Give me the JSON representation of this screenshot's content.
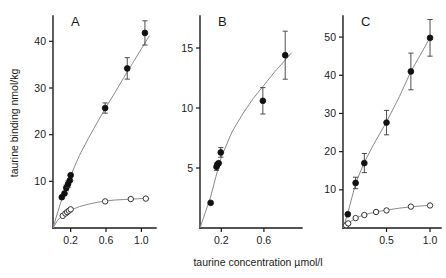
{
  "figure": {
    "xlabel": "taurine concentration  µmol/l",
    "ylabel": "taurine binding  nmol/kg"
  },
  "chart_data": [
    {
      "type": "scatter",
      "panel": "A",
      "title": "A",
      "xlabel": "taurine concentration  µmol/l",
      "ylabel": "taurine binding  nmol/kg",
      "xlim": [
        0,
        1.12
      ],
      "ylim": [
        0,
        45
      ],
      "xticks": [
        0.2,
        0.6,
        1.0
      ],
      "xticklabels": [
        "0.2",
        "0.6",
        "1.0"
      ],
      "yticks": [
        10,
        20,
        30,
        40
      ],
      "yticklabels": [
        "10",
        "20",
        "30",
        "40"
      ],
      "grid": false,
      "legend": null,
      "series": [
        {
          "name": "total binding",
          "marker": "filled-circle",
          "x": [
            0.1,
            0.13,
            0.15,
            0.17,
            0.19,
            0.2,
            0.59,
            0.84,
            1.04
          ],
          "y": [
            6.6,
            7.4,
            8.6,
            9.4,
            10.2,
            11.3,
            25.7,
            34.2,
            41.8
          ],
          "yerr": [
            0.0,
            0.0,
            0.6,
            0.7,
            0.0,
            0.0,
            1.1,
            2.3,
            2.6
          ]
        },
        {
          "name": "non-specific binding",
          "marker": "open-circle",
          "x": [
            0.11,
            0.14,
            0.16,
            0.18,
            0.2,
            0.59,
            0.88,
            1.05
          ],
          "y": [
            2.6,
            3.1,
            3.4,
            3.7,
            4.0,
            5.7,
            6.2,
            6.3
          ],
          "yerr": [
            0.0,
            0.0,
            0.0,
            0.0,
            0.0,
            0.0,
            0.0,
            0.0
          ]
        }
      ],
      "curves": [
        {
          "name": "total fit",
          "x": [
            0.0,
            0.05,
            0.1,
            0.15,
            0.2,
            0.3,
            0.4,
            0.5,
            0.6,
            0.7,
            0.8,
            0.9,
            1.0,
            1.09
          ],
          "y": [
            0.0,
            3.2,
            6.2,
            8.8,
            11.2,
            15.6,
            19.2,
            22.6,
            25.9,
            29.0,
            32.2,
            35.3,
            38.4,
            41.2
          ]
        },
        {
          "name": "non-specific fit",
          "x": [
            0.0,
            0.05,
            0.1,
            0.15,
            0.2,
            0.3,
            0.4,
            0.5,
            0.6,
            0.7,
            0.8,
            0.9,
            1.0,
            1.09
          ],
          "y": [
            0.0,
            1.6,
            2.6,
            3.3,
            3.8,
            4.6,
            5.1,
            5.5,
            5.8,
            6.0,
            6.1,
            6.2,
            6.3,
            6.35
          ]
        }
      ]
    },
    {
      "type": "scatter",
      "panel": "B",
      "title": "B",
      "xlabel": "taurine concentration  µmol/l",
      "ylabel": "taurine binding  nmol/kg",
      "xlim": [
        0,
        0.92
      ],
      "ylim": [
        0,
        17.5
      ],
      "xticks": [
        0.2,
        0.6
      ],
      "xticklabels": [
        "0.2",
        "0.6"
      ],
      "yticks": [
        5,
        10,
        15
      ],
      "yticklabels": [
        "5",
        "10",
        "15"
      ],
      "grid": false,
      "legend": null,
      "series": [
        {
          "name": "total binding",
          "marker": "filled-circle",
          "x": [
            0.1,
            0.155,
            0.165,
            0.175,
            0.195,
            0.59,
            0.8
          ],
          "y": [
            2.1,
            5.1,
            5.3,
            5.4,
            6.3,
            10.6,
            14.4
          ],
          "yerr": [
            0.0,
            0.3,
            0.0,
            0.0,
            0.4,
            1.1,
            2.0
          ]
        }
      ],
      "curves": [
        {
          "name": "total fit",
          "x": [
            0.0,
            0.05,
            0.1,
            0.15,
            0.2,
            0.3,
            0.4,
            0.5,
            0.6,
            0.7,
            0.8,
            0.86
          ],
          "y": [
            0.0,
            1.3,
            2.6,
            4.3,
            5.9,
            8.0,
            9.5,
            10.8,
            11.9,
            13.0,
            14.0,
            14.6
          ]
        }
      ]
    },
    {
      "type": "scatter",
      "panel": "C",
      "title": "C",
      "xlabel": "taurine concentration  µmol/l",
      "ylabel": "taurine binding  nmol/kg",
      "xlim": [
        0,
        1.08
      ],
      "ylim": [
        0,
        55
      ],
      "xticks": [
        0.5,
        1.0
      ],
      "xticklabels": [
        "0.5",
        "1.0"
      ],
      "yticks": [
        10,
        20,
        30,
        40,
        50
      ],
      "yticklabels": [
        "10",
        "20",
        "30",
        "40",
        "50"
      ],
      "grid": false,
      "legend": null,
      "series": [
        {
          "name": "total binding",
          "marker": "filled-circle",
          "x": [
            0.055,
            0.145,
            0.245,
            0.5,
            0.78,
            1.0
          ],
          "y": [
            3.6,
            11.8,
            17.0,
            27.6,
            41.0,
            49.8
          ],
          "yerr": [
            0.0,
            1.5,
            2.5,
            3.2,
            4.8,
            4.8
          ]
        },
        {
          "name": "non-specific binding",
          "marker": "open-circle",
          "x": [
            0.035,
            0.06,
            0.145,
            0.245,
            0.38,
            0.5,
            0.78,
            1.0
          ],
          "y": [
            0.7,
            1.2,
            2.6,
            3.4,
            4.2,
            4.6,
            5.6,
            5.9
          ],
          "yerr": [
            0.0,
            0.0,
            0.0,
            0.0,
            0.0,
            0.0,
            0.0,
            0.0
          ]
        }
      ],
      "curves": [
        {
          "name": "total fit",
          "x": [
            0.0,
            0.05,
            0.145,
            0.245,
            0.35,
            0.5,
            0.65,
            0.78,
            0.9,
            1.0
          ],
          "y": [
            0.0,
            3.4,
            11.7,
            17.2,
            21.8,
            27.8,
            34.5,
            41.0,
            45.8,
            49.9
          ]
        },
        {
          "name": "non-specific fit",
          "x": [
            0.0,
            0.05,
            0.1,
            0.2,
            0.3,
            0.4,
            0.5,
            0.65,
            0.8,
            1.0
          ],
          "y": [
            0.0,
            1.0,
            1.9,
            3.1,
            3.8,
            4.3,
            4.7,
            5.2,
            5.6,
            5.95
          ]
        }
      ]
    }
  ]
}
